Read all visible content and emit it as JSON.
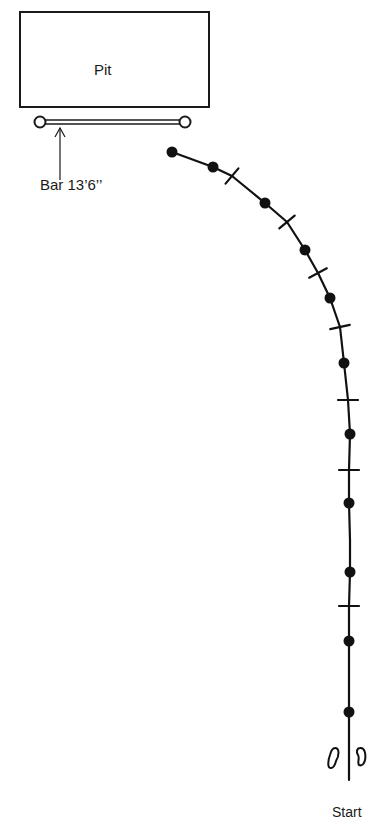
{
  "diagram": {
    "pit": {
      "label": "Pit",
      "box": {
        "x": 20,
        "y": 12,
        "w": 189,
        "h": 95
      }
    },
    "bar": {
      "label": "Bar 13’6’’",
      "left_end": {
        "x": 40,
        "y": 122
      },
      "right_end": {
        "x": 185,
        "y": 122
      },
      "arrow": {
        "x": 60,
        "y_tip": 128,
        "y_tail": 180
      }
    },
    "approach_run": {
      "path_points": [
        [
          172,
          152
        ],
        [
          213,
          167
        ],
        [
          232,
          176
        ],
        [
          265,
          203
        ],
        [
          287,
          222
        ],
        [
          305,
          250
        ],
        [
          318,
          273
        ],
        [
          330,
          298
        ],
        [
          340,
          327
        ],
        [
          344,
          363
        ],
        [
          348,
          400
        ],
        [
          350,
          434
        ],
        [
          349,
          470
        ],
        [
          349,
          503
        ],
        [
          350,
          540
        ],
        [
          350,
          572
        ],
        [
          349,
          606
        ],
        [
          349,
          641
        ],
        [
          349,
          712
        ],
        [
          349,
          780
        ]
      ],
      "stride_dots": [
        {
          "x": 172,
          "y": 152
        },
        {
          "x": 213,
          "y": 167
        },
        {
          "x": 265,
          "y": 203
        },
        {
          "x": 305,
          "y": 250
        },
        {
          "x": 330,
          "y": 298
        },
        {
          "x": 344,
          "y": 363
        },
        {
          "x": 350,
          "y": 434
        },
        {
          "x": 349,
          "y": 503
        },
        {
          "x": 350,
          "y": 572
        },
        {
          "x": 349,
          "y": 641
        },
        {
          "x": 349,
          "y": 712
        }
      ],
      "check_marks": [
        {
          "x": 232,
          "y": 176,
          "angle": -50
        },
        {
          "x": 287,
          "y": 222,
          "angle": -40
        },
        {
          "x": 318,
          "y": 273,
          "angle": -28
        },
        {
          "x": 340,
          "y": 327,
          "angle": -12
        },
        {
          "x": 348,
          "y": 400,
          "angle": 0
        },
        {
          "x": 349,
          "y": 470,
          "angle": 0
        },
        {
          "x": 349,
          "y": 606,
          "angle": 0
        }
      ]
    },
    "start": {
      "label": "Start",
      "footprints": [
        {
          "side": "left",
          "x": 333,
          "y": 758
        },
        {
          "side": "right",
          "x": 361,
          "y": 757
        }
      ]
    }
  }
}
